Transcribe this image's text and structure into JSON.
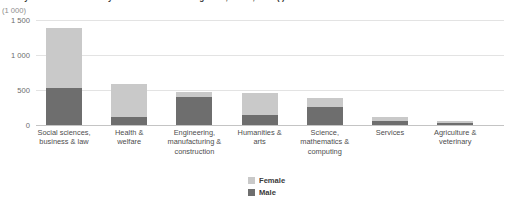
{
  "chart_data": {
    "type": "bar",
    "title": "Tertiary students in the EU by field of education and gender, EU-27, 2009 (¹)",
    "subtitle": "",
    "unit_label": "(1 000)",
    "xlabel": "",
    "ylabel": "",
    "stacked": true,
    "grid": true,
    "legend_position": "bottom-center",
    "ylim": [
      0,
      1500
    ],
    "yticks": [
      0,
      500,
      1000,
      1500
    ],
    "ytick_labels": [
      "0",
      "500",
      "1 000",
      "1 500"
    ],
    "categories": [
      "Social sciences, business & law",
      "Health & welfare",
      "Engineering, manufacturing & construction",
      "Humanities & arts",
      "Science, mathematics & computing",
      "Services",
      "Agriculture & veterinary"
    ],
    "category_lines": [
      [
        "Social sciences,",
        "business & law"
      ],
      [
        "Health &",
        "welfare"
      ],
      [
        "Engineering,",
        "manufacturing &",
        "construction"
      ],
      [
        "Humanities &",
        "arts"
      ],
      [
        "Science,",
        "mathematics &",
        "computing"
      ],
      [
        "Services"
      ],
      [
        "Agriculture &",
        "veterinary"
      ]
    ],
    "series": [
      {
        "name": "Male",
        "color": "#6e6e6e",
        "values": [
          530,
          120,
          400,
          150,
          255,
          60,
          30
        ]
      },
      {
        "name": "Female",
        "color": "#c9c9c9",
        "values": [
          850,
          470,
          70,
          305,
          125,
          55,
          25
        ]
      }
    ],
    "totals": [
      1380,
      590,
      470,
      455,
      380,
      115,
      55
    ]
  },
  "legend": {
    "items": [
      {
        "label": "Female",
        "color": "#c9c9c9"
      },
      {
        "label": "Male",
        "color": "#6e6e6e"
      }
    ]
  }
}
